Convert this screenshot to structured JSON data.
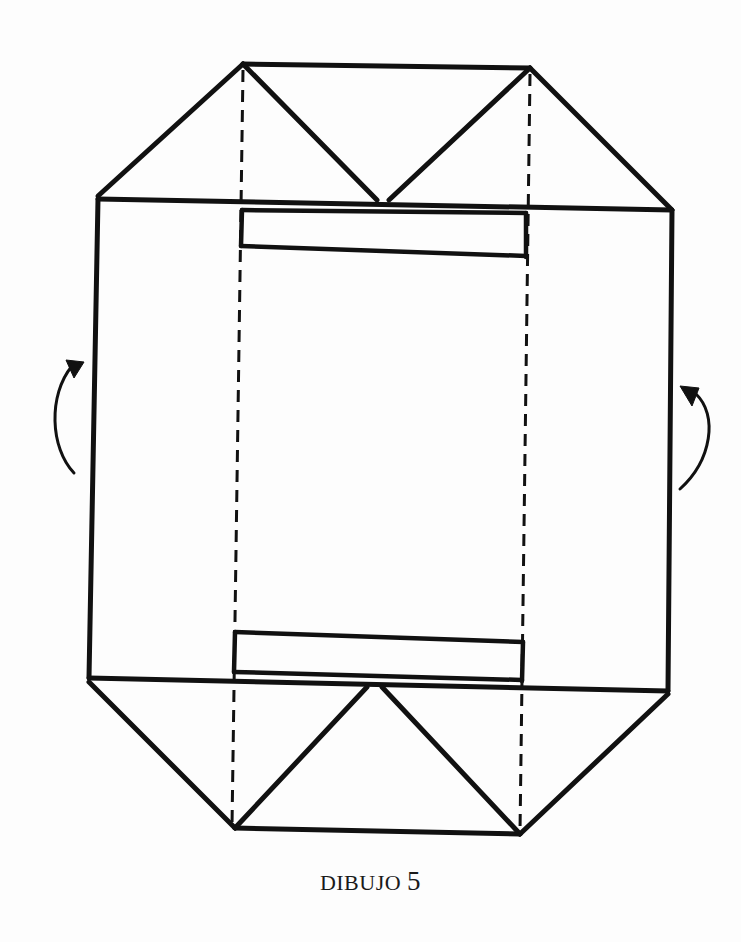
{
  "figure": {
    "caption_word": "DIBUJO",
    "caption_number": "5",
    "colors": {
      "ink": "#111111",
      "paper": "#fdfdfd"
    },
    "arrows": [
      {
        "side": "left",
        "direction": "up-right",
        "icon": "curved-fold-arrow"
      },
      {
        "side": "right",
        "direction": "up-left",
        "icon": "curved-fold-arrow"
      }
    ],
    "lines": {
      "solid": "outline and flap edges",
      "dashed": "fold lines (valley folds)"
    }
  }
}
